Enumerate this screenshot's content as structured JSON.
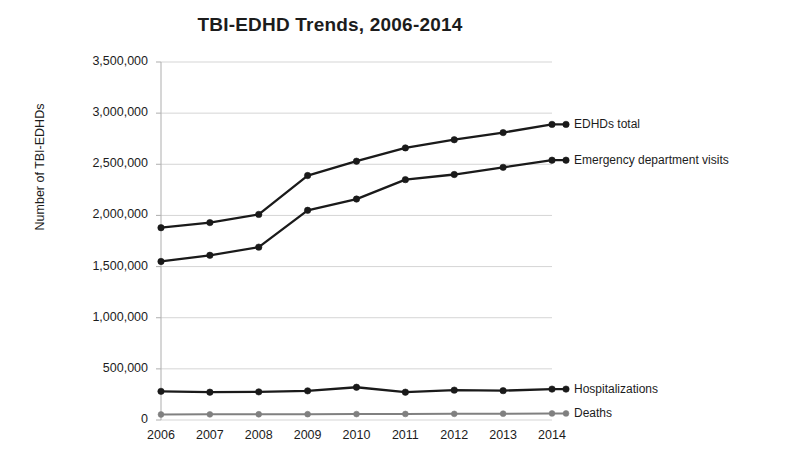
{
  "chart_data": {
    "type": "line",
    "title": "TBI-EDHD Trends, 2006-2014",
    "xlabel": "",
    "ylabel": "Number of TBI-EDHDs",
    "categories": [
      "2006",
      "2007",
      "2008",
      "2009",
      "2010",
      "2011",
      "2012",
      "2013",
      "2014"
    ],
    "x": [
      2006,
      2007,
      2008,
      2009,
      2010,
      2011,
      2012,
      2013,
      2014
    ],
    "ylim": [
      0,
      3500000
    ],
    "ytick_labels": [
      "3,500,000",
      "3,000,000",
      "2,500,000",
      "2,000,000",
      "1,500,000",
      "1,000,000",
      "500,000",
      "0"
    ],
    "ytick_values": [
      3500000,
      3000000,
      2500000,
      2000000,
      1500000,
      1000000,
      500000,
      0
    ],
    "grid": true,
    "legend_position": "right-inline-labels",
    "series": [
      {
        "name": "EDHDs total",
        "color": "#1a1a1a",
        "values": [
          1880000,
          1930000,
          2010000,
          2390000,
          2530000,
          2660000,
          2740000,
          2810000,
          2890000
        ]
      },
      {
        "name": "Emergency department visits",
        "color": "#1a1a1a",
        "values": [
          1550000,
          1610000,
          1690000,
          2050000,
          2160000,
          2350000,
          2400000,
          2470000,
          2540000
        ]
      },
      {
        "name": "Hospitalizations",
        "color": "#1a1a1a",
        "values": [
          280000,
          272000,
          275000,
          285000,
          320000,
          272000,
          292000,
          287000,
          302000
        ]
      },
      {
        "name": "Deaths",
        "color": "#808080",
        "values": [
          54000,
          55000,
          56000,
          57000,
          58000,
          59000,
          60000,
          62000,
          64000
        ]
      }
    ]
  },
  "colors": {
    "primary_line": "#1a1a1a",
    "secondary_line": "#808080",
    "gridline": "#d0d0d0",
    "axis": "#b5b5b5",
    "text": "#1c1c1c",
    "background": "#ffffff"
  }
}
